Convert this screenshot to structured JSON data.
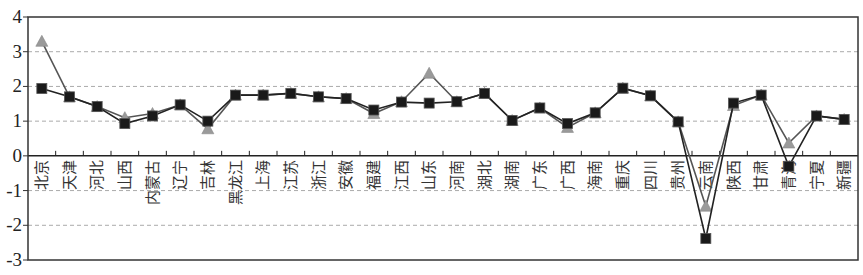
{
  "chart_data": {
    "type": "line",
    "title": "",
    "xlabel": "",
    "ylabel": "",
    "ylim": [
      -3,
      4
    ],
    "yticks": [
      4,
      3,
      2,
      1,
      0,
      -1,
      -2,
      -3
    ],
    "grid": {
      "horizontal": true,
      "style": "dashed"
    },
    "legend": null,
    "categories": [
      "北京",
      "天津",
      "河北",
      "山西",
      "内蒙古",
      "辽宁",
      "吉林",
      "黑龙江",
      "上海",
      "江苏",
      "浙江",
      "安徽",
      "福建",
      "江西",
      "山东",
      "河南",
      "湖北",
      "湖南",
      "广东",
      "广西",
      "海南",
      "重庆",
      "四川",
      "贵州",
      "云南",
      "陕西",
      "甘肃",
      "青海",
      "宁夏",
      "新疆"
    ],
    "series": [
      {
        "name": "series-triangle",
        "marker": "triangle",
        "color": "#9a9a9a",
        "line_color": "#555555",
        "values": [
          3.3,
          1.7,
          1.42,
          1.1,
          1.22,
          1.47,
          0.78,
          1.75,
          1.75,
          1.8,
          1.7,
          1.65,
          1.22,
          1.56,
          2.38,
          1.56,
          1.8,
          1.02,
          1.38,
          0.82,
          1.24,
          1.95,
          1.73,
          0.98,
          -1.45,
          1.45,
          1.75,
          0.37,
          1.15,
          1.05
        ]
      },
      {
        "name": "series-square",
        "marker": "square",
        "color": "#1a1a1a",
        "line_color": "#222222",
        "values": [
          1.94,
          1.7,
          1.42,
          0.93,
          1.15,
          1.47,
          1.0,
          1.75,
          1.75,
          1.8,
          1.7,
          1.65,
          1.32,
          1.55,
          1.52,
          1.56,
          1.8,
          1.02,
          1.38,
          0.93,
          1.24,
          1.95,
          1.73,
          0.98,
          -2.38,
          1.52,
          1.75,
          -0.3,
          1.15,
          1.05
        ]
      }
    ]
  },
  "layout": {
    "plot_left": 28,
    "plot_right": 858,
    "plot_top": 17,
    "plot_bottom": 260
  }
}
